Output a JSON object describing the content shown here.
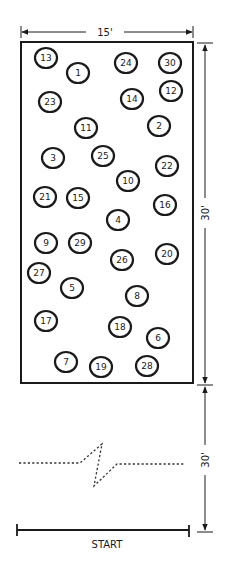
{
  "diagram": {
    "width_label": "15'",
    "course_length_label": "30'",
    "approach_length_label": "30'",
    "start_label": "START",
    "stroke_color": "#1a1a1a",
    "background": "#ffffff",
    "course_rect": {
      "x": 21,
      "y": 42,
      "w": 172,
      "h": 341
    },
    "cones": [
      {
        "num": "13",
        "x": 46,
        "y": 58
      },
      {
        "num": "1",
        "x": 78,
        "y": 73
      },
      {
        "num": "24",
        "x": 126,
        "y": 63
      },
      {
        "num": "30",
        "x": 170,
        "y": 63
      },
      {
        "num": "12",
        "x": 171,
        "y": 91
      },
      {
        "num": "14",
        "x": 132,
        "y": 99
      },
      {
        "num": "23",
        "x": 50,
        "y": 102
      },
      {
        "num": "11",
        "x": 86,
        "y": 128
      },
      {
        "num": "2",
        "x": 159,
        "y": 126
      },
      {
        "num": "3",
        "x": 53,
        "y": 158
      },
      {
        "num": "25",
        "x": 103,
        "y": 156
      },
      {
        "num": "22",
        "x": 167,
        "y": 166
      },
      {
        "num": "10",
        "x": 128,
        "y": 181
      },
      {
        "num": "21",
        "x": 45,
        "y": 197
      },
      {
        "num": "15",
        "x": 78,
        "y": 198
      },
      {
        "num": "16",
        "x": 165,
        "y": 205
      },
      {
        "num": "4",
        "x": 118,
        "y": 220
      },
      {
        "num": "9",
        "x": 46,
        "y": 243
      },
      {
        "num": "29",
        "x": 80,
        "y": 243
      },
      {
        "num": "20",
        "x": 167,
        "y": 254
      },
      {
        "num": "26",
        "x": 122,
        "y": 260
      },
      {
        "num": "27",
        "x": 39,
        "y": 273
      },
      {
        "num": "5",
        "x": 72,
        "y": 288
      },
      {
        "num": "8",
        "x": 137,
        "y": 296
      },
      {
        "num": "17",
        "x": 46,
        "y": 321
      },
      {
        "num": "18",
        "x": 120,
        "y": 327
      },
      {
        "num": "6",
        "x": 158,
        "y": 338
      },
      {
        "num": "7",
        "x": 66,
        "y": 362
      },
      {
        "num": "19",
        "x": 101,
        "y": 367
      },
      {
        "num": "28",
        "x": 147,
        "y": 366
      }
    ]
  }
}
